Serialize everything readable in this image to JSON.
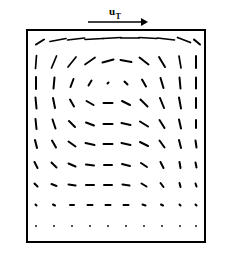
{
  "figure": {
    "caption_label": "u",
    "caption_subscript": "T",
    "title": ""
  },
  "lid_arrow": {
    "name": "lid-velocity-arrow",
    "label": "u",
    "subscript": "T",
    "x1": 88,
    "y1": 22,
    "x2": 148,
    "y2": 22,
    "head_size": 7,
    "color": "#000000",
    "label_x": 112,
    "label_y": 15
  },
  "frame": {
    "x": 27,
    "y": 30,
    "width": 178,
    "height": 212,
    "stroke": "#000000",
    "stroke_width": 2.0,
    "fill": "#ffffff"
  },
  "style": {
    "vector_color": "#000000",
    "vector_stroke_width": 2.0,
    "background": "#ffffff"
  },
  "chart_data": {
    "type": "quiver",
    "title": "",
    "xlabel": "",
    "ylabel": "",
    "legend": "u_T",
    "grid": false,
    "xlim": [
      0,
      1
    ],
    "ylim": [
      0,
      1
    ],
    "n_cols": 10,
    "n_rows": 11,
    "annotations": [
      "u_T"
    ],
    "note": "Lid-driven cavity flow: top wall moves right with velocity u_T; primary vortex core near (0.47, 0.75) of cavity.",
    "vectors": [
      {
        "x": 40,
        "y": 42,
        "dx": 8,
        "dy": -5
      },
      {
        "x": 58,
        "y": 40,
        "dx": 16,
        "dy": -3
      },
      {
        "x": 76,
        "y": 39,
        "dx": 17,
        "dy": -2
      },
      {
        "x": 94,
        "y": 39,
        "dx": 18,
        "dy": -1
      },
      {
        "x": 112,
        "y": 38,
        "dx": 18,
        "dy": -1
      },
      {
        "x": 130,
        "y": 38,
        "dx": 18,
        "dy": 0
      },
      {
        "x": 148,
        "y": 38,
        "dx": 18,
        "dy": 1
      },
      {
        "x": 166,
        "y": 39,
        "dx": 17,
        "dy": 2
      },
      {
        "x": 184,
        "y": 40,
        "dx": 13,
        "dy": 5
      },
      {
        "x": 197,
        "y": 42,
        "dx": 6,
        "dy": 5
      },
      {
        "x": 36,
        "y": 62,
        "dx": 1,
        "dy": -13
      },
      {
        "x": 54,
        "y": 62,
        "dx": 5,
        "dy": -12
      },
      {
        "x": 72,
        "y": 62,
        "dx": 8,
        "dy": -10
      },
      {
        "x": 90,
        "y": 61,
        "dx": 10,
        "dy": -7
      },
      {
        "x": 108,
        "y": 61,
        "dx": 11,
        "dy": -3
      },
      {
        "x": 126,
        "y": 61,
        "dx": 11,
        "dy": 2
      },
      {
        "x": 144,
        "y": 61,
        "dx": 9,
        "dy": 7
      },
      {
        "x": 162,
        "y": 62,
        "dx": 6,
        "dy": 10
      },
      {
        "x": 180,
        "y": 62,
        "dx": 2,
        "dy": 12
      },
      {
        "x": 196,
        "y": 62,
        "dx": 0,
        "dy": 12
      },
      {
        "x": 36,
        "y": 83,
        "dx": 0,
        "dy": -12
      },
      {
        "x": 54,
        "y": 83,
        "dx": 1,
        "dy": -11
      },
      {
        "x": 72,
        "y": 83,
        "dx": 3,
        "dy": -8
      },
      {
        "x": 90,
        "y": 83,
        "dx": 3,
        "dy": -5
      },
      {
        "x": 108,
        "y": 83,
        "dx": 1,
        "dy": -1
      },
      {
        "x": 126,
        "y": 83,
        "dx": 3,
        "dy": 3
      },
      {
        "x": 144,
        "y": 83,
        "dx": 4,
        "dy": 7
      },
      {
        "x": 162,
        "y": 83,
        "dx": 3,
        "dy": 10
      },
      {
        "x": 180,
        "y": 83,
        "dx": 1,
        "dy": 11
      },
      {
        "x": 196,
        "y": 83,
        "dx": 0,
        "dy": 11
      },
      {
        "x": 36,
        "y": 103,
        "dx": -1,
        "dy": -11
      },
      {
        "x": 54,
        "y": 103,
        "dx": -2,
        "dy": -10
      },
      {
        "x": 72,
        "y": 103,
        "dx": -4,
        "dy": -7
      },
      {
        "x": 90,
        "y": 103,
        "dx": -7,
        "dy": -4
      },
      {
        "x": 108,
        "y": 103,
        "dx": -9,
        "dy": 0
      },
      {
        "x": 126,
        "y": 103,
        "dx": 8,
        "dy": 4
      },
      {
        "x": 144,
        "y": 103,
        "dx": 7,
        "dy": 7
      },
      {
        "x": 162,
        "y": 103,
        "dx": 4,
        "dy": 10
      },
      {
        "x": 180,
        "y": 103,
        "dx": 2,
        "dy": 11
      },
      {
        "x": 196,
        "y": 103,
        "dx": 0,
        "dy": 10
      },
      {
        "x": 36,
        "y": 124,
        "dx": -1,
        "dy": -10
      },
      {
        "x": 54,
        "y": 124,
        "dx": -3,
        "dy": -9
      },
      {
        "x": 72,
        "y": 124,
        "dx": -6,
        "dy": -6
      },
      {
        "x": 90,
        "y": 124,
        "dx": -8,
        "dy": -3
      },
      {
        "x": 108,
        "y": 124,
        "dx": -9,
        "dy": 0
      },
      {
        "x": 126,
        "y": 124,
        "dx": 9,
        "dy": 2
      },
      {
        "x": 144,
        "y": 124,
        "dx": 8,
        "dy": 5
      },
      {
        "x": 162,
        "y": 124,
        "dx": 5,
        "dy": 8
      },
      {
        "x": 180,
        "y": 124,
        "dx": 2,
        "dy": 9
      },
      {
        "x": 196,
        "y": 124,
        "dx": 0,
        "dy": 8
      },
      {
        "x": 36,
        "y": 144,
        "dx": -2,
        "dy": -8
      },
      {
        "x": 54,
        "y": 144,
        "dx": -4,
        "dy": -7
      },
      {
        "x": 72,
        "y": 144,
        "dx": -7,
        "dy": -5
      },
      {
        "x": 90,
        "y": 144,
        "dx": -9,
        "dy": -2
      },
      {
        "x": 108,
        "y": 144,
        "dx": -9,
        "dy": 0
      },
      {
        "x": 126,
        "y": 144,
        "dx": 9,
        "dy": 2
      },
      {
        "x": 144,
        "y": 144,
        "dx": 8,
        "dy": 4
      },
      {
        "x": 162,
        "y": 144,
        "dx": 5,
        "dy": 7
      },
      {
        "x": 180,
        "y": 144,
        "dx": 2,
        "dy": 8
      },
      {
        "x": 196,
        "y": 144,
        "dx": 1,
        "dy": 7
      },
      {
        "x": 36,
        "y": 165,
        "dx": -3,
        "dy": -6
      },
      {
        "x": 54,
        "y": 165,
        "dx": -5,
        "dy": -5
      },
      {
        "x": 72,
        "y": 165,
        "dx": -7,
        "dy": -3
      },
      {
        "x": 90,
        "y": 165,
        "dx": -8,
        "dy": -1
      },
      {
        "x": 108,
        "y": 165,
        "dx": -8,
        "dy": 0
      },
      {
        "x": 126,
        "y": 165,
        "dx": 8,
        "dy": 2
      },
      {
        "x": 144,
        "y": 165,
        "dx": 6,
        "dy": 4
      },
      {
        "x": 162,
        "y": 165,
        "dx": 3,
        "dy": 6
      },
      {
        "x": 180,
        "y": 165,
        "dx": 1,
        "dy": 6
      },
      {
        "x": 196,
        "y": 165,
        "dx": 1,
        "dy": 5
      },
      {
        "x": 36,
        "y": 185,
        "dx": -3,
        "dy": -3
      },
      {
        "x": 54,
        "y": 185,
        "dx": -5,
        "dy": -2
      },
      {
        "x": 72,
        "y": 185,
        "dx": -7,
        "dy": -1
      },
      {
        "x": 90,
        "y": 185,
        "dx": -8,
        "dy": 0
      },
      {
        "x": 108,
        "y": 185,
        "dx": -8,
        "dy": 0
      },
      {
        "x": 126,
        "y": 185,
        "dx": 7,
        "dy": 1
      },
      {
        "x": 144,
        "y": 185,
        "dx": 5,
        "dy": 3
      },
      {
        "x": 162,
        "y": 185,
        "dx": 3,
        "dy": 4
      },
      {
        "x": 180,
        "y": 185,
        "dx": 1,
        "dy": 4
      },
      {
        "x": 196,
        "y": 185,
        "dx": 1,
        "dy": 3
      },
      {
        "x": 36,
        "y": 205,
        "dx": -1,
        "dy": -1
      },
      {
        "x": 54,
        "y": 205,
        "dx": -2,
        "dy": -1
      },
      {
        "x": 72,
        "y": 205,
        "dx": -4,
        "dy": 0
      },
      {
        "x": 90,
        "y": 205,
        "dx": -5,
        "dy": 0
      },
      {
        "x": 108,
        "y": 205,
        "dx": -5,
        "dy": 0
      },
      {
        "x": 126,
        "y": 205,
        "dx": 5,
        "dy": 0
      },
      {
        "x": 144,
        "y": 205,
        "dx": 3,
        "dy": 1
      },
      {
        "x": 162,
        "y": 205,
        "dx": 2,
        "dy": 1
      },
      {
        "x": 180,
        "y": 205,
        "dx": 1,
        "dy": 1
      },
      {
        "x": 196,
        "y": 205,
        "dx": 1,
        "dy": 1
      },
      {
        "x": 36,
        "y": 226,
        "dx": 0,
        "dy": 0
      },
      {
        "x": 54,
        "y": 226,
        "dx": 0,
        "dy": 0
      },
      {
        "x": 72,
        "y": 226,
        "dx": 0,
        "dy": 0
      },
      {
        "x": 90,
        "y": 226,
        "dx": 0,
        "dy": 0
      },
      {
        "x": 108,
        "y": 226,
        "dx": 0,
        "dy": 0
      },
      {
        "x": 126,
        "y": 226,
        "dx": 0,
        "dy": 0
      },
      {
        "x": 144,
        "y": 226,
        "dx": 0,
        "dy": 0
      },
      {
        "x": 162,
        "y": 226,
        "dx": 0,
        "dy": 0
      },
      {
        "x": 180,
        "y": 226,
        "dx": 0,
        "dy": 0
      },
      {
        "x": 196,
        "y": 226,
        "dx": 0,
        "dy": 0
      }
    ]
  }
}
